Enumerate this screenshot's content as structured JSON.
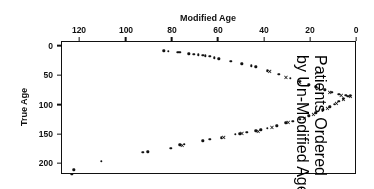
{
  "figure": {
    "orientation": "rotated-180",
    "background": "#ffffff",
    "ink_color": "#111111"
  },
  "annotation": {
    "line1": "Patients Ordered",
    "line2": "by Un-Modified Age"
  },
  "chart_data": {
    "type": "scatter",
    "title": "",
    "xlabel": "Modified Age",
    "ylabel": "True Age",
    "xlim": [
      0,
      128
    ],
    "ylim": [
      -8,
      218
    ],
    "xticks": [
      0,
      20,
      40,
      60,
      80,
      100,
      120
    ],
    "xticklabels": [
      "0",
      "20",
      "40",
      "60",
      "80",
      "100",
      "120"
    ],
    "yticks": [
      0,
      50,
      100,
      150,
      200
    ],
    "yticklabels": [
      "0",
      "50",
      "100",
      "150",
      "200"
    ],
    "grid": false,
    "legend": false,
    "xaxis_position": "bottom",
    "yaxis_position": "right",
    "series": [
      {
        "name": "Upper branch (dot markers)",
        "marker": "dot",
        "points": [
          [
            122,
            213
          ],
          [
            110,
            198
          ],
          [
            92,
            183
          ],
          [
            90,
            182
          ],
          [
            80,
            176
          ],
          [
            76,
            170
          ],
          [
            74,
            169
          ],
          [
            66,
            163
          ],
          [
            63,
            161
          ],
          [
            58,
            158
          ],
          [
            52,
            152
          ],
          [
            50,
            151
          ],
          [
            47,
            149
          ],
          [
            43,
            146
          ],
          [
            41,
            145
          ],
          [
            38,
            142
          ],
          [
            34,
            138
          ],
          [
            30,
            133
          ],
          [
            27,
            130
          ],
          [
            24,
            127
          ],
          [
            20,
            121
          ],
          [
            17,
            116
          ],
          [
            14,
            111
          ],
          [
            11,
            106
          ],
          [
            9,
            101
          ],
          [
            7,
            96
          ],
          [
            5,
            92
          ],
          [
            3,
            88
          ]
        ]
      },
      {
        "name": "Upper branch (x markers)",
        "marker": "x",
        "points": [
          [
            75,
            170
          ],
          [
            57,
            157
          ],
          [
            49,
            150
          ],
          [
            42,
            146
          ],
          [
            36,
            140
          ],
          [
            29,
            132
          ],
          [
            22,
            124
          ],
          [
            18,
            117
          ],
          [
            12,
            108
          ],
          [
            8,
            99
          ],
          [
            5,
            93
          ],
          [
            2,
            87
          ]
        ]
      },
      {
        "name": "Lower branch (dot markers)",
        "marker": "dot",
        "points": [
          [
            83,
            10
          ],
          [
            81,
            11
          ],
          [
            77,
            13
          ],
          [
            76,
            13
          ],
          [
            72,
            15
          ],
          [
            70,
            16
          ],
          [
            68,
            17
          ],
          [
            66,
            18
          ],
          [
            65,
            19
          ],
          [
            63,
            20
          ],
          [
            61,
            22
          ],
          [
            59,
            24
          ],
          [
            54,
            28
          ],
          [
            49,
            32
          ],
          [
            45,
            36
          ],
          [
            43,
            38
          ],
          [
            38,
            44
          ],
          [
            33,
            50
          ],
          [
            28,
            57
          ],
          [
            24,
            62
          ],
          [
            20,
            68
          ],
          [
            17,
            72
          ],
          [
            13,
            77
          ],
          [
            10,
            81
          ],
          [
            7,
            84
          ],
          [
            4,
            86
          ],
          [
            2,
            87
          ]
        ]
      },
      {
        "name": "Lower branch (x markers)",
        "marker": "x",
        "points": [
          [
            37,
            45
          ],
          [
            30,
            55
          ],
          [
            24,
            63
          ],
          [
            16,
            73
          ],
          [
            11,
            80
          ],
          [
            6,
            85
          ]
        ]
      },
      {
        "name": "Outlier above frame",
        "marker": "dot",
        "points": [
          [
            123,
            220
          ]
        ]
      }
    ]
  }
}
